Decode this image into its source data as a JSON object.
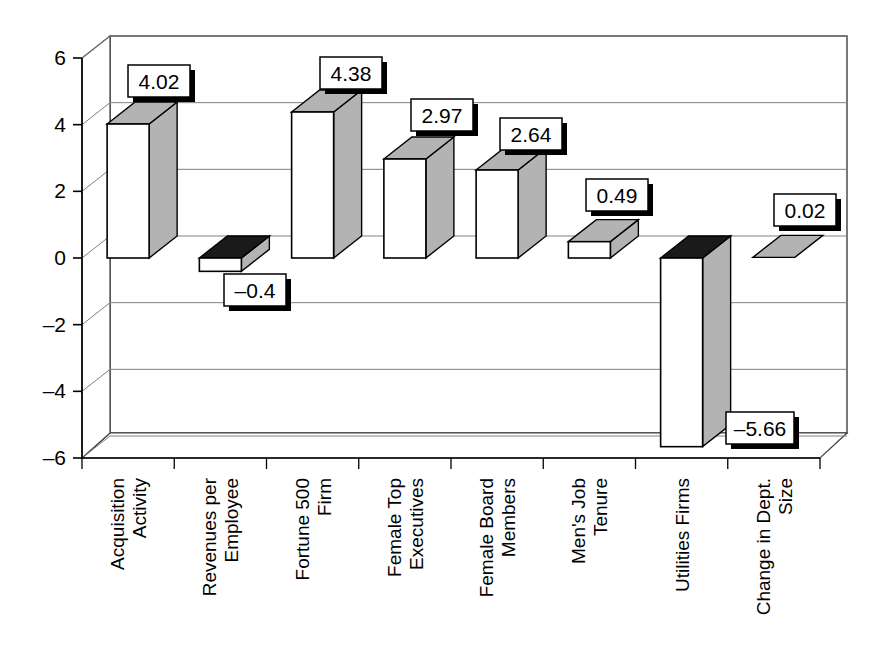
{
  "chart_data": {
    "type": "bar",
    "title": "",
    "subtitle": "",
    "xlabel": "",
    "ylabel": "",
    "categories": [
      "Acquisition Activity",
      "Revenues per Employee",
      "Fortune 500 Firm",
      "Female Top Executives",
      "Female Board Members",
      "Men's Job Tenure",
      "Utilities Firms",
      "Change in Dept. Size"
    ],
    "category_lines": [
      [
        "Acquisition",
        "Activity"
      ],
      [
        "Revenues per",
        "Employee"
      ],
      [
        "Fortune 500",
        "Firm"
      ],
      [
        "Female Top",
        "Executives"
      ],
      [
        "Female Board",
        "Members"
      ],
      [
        "Men's Job",
        "Tenure"
      ],
      [
        "Utilities Firms"
      ],
      [
        "Change in Dept.",
        "Size"
      ]
    ],
    "values": [
      4.02,
      -0.4,
      4.38,
      2.97,
      2.64,
      0.49,
      -5.66,
      0.02
    ],
    "value_labels": [
      "4.02",
      "–0.4",
      "4.38",
      "2.97",
      "2.64",
      "0.49",
      "–5.66",
      "0.02"
    ],
    "ylim": [
      -6,
      6
    ],
    "yticks": [
      6,
      4,
      2,
      0,
      -2,
      -4,
      -6
    ],
    "ytick_labels": [
      "6",
      "4",
      "2",
      "0",
      "–2",
      "–4",
      "–6"
    ],
    "grid": true,
    "legend": "none",
    "style": "3d-column",
    "colors": {
      "bar_front": "#ffffff",
      "bar_side_positive": "#b3b3b3",
      "bar_top_positive": "#b3b3b3",
      "bar_top_negative": "#1a1a1a",
      "outline": "#000000",
      "gridline": "#808080",
      "label_box_fill": "#ffffff",
      "label_box_border": "#000000",
      "label_box_shadow": "#000000",
      "background": "#ffffff"
    }
  }
}
